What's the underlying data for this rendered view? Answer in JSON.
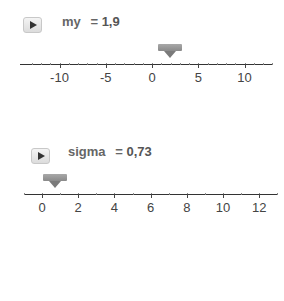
{
  "sliders": [
    {
      "name": "my",
      "equals": "=",
      "value_text": "1,9",
      "value": 1.9,
      "min": -13,
      "max": 13,
      "ticks": [
        {
          "label": "-10",
          "value": -10
        },
        {
          "label": "-5",
          "value": -5
        },
        {
          "label": "0",
          "value": 0
        },
        {
          "label": "5",
          "value": 5
        },
        {
          "label": "10",
          "value": 10
        }
      ],
      "play_icon": "play-icon"
    },
    {
      "name": "sigma",
      "equals": "=",
      "value_text": "0,73",
      "value": 0.73,
      "min": -1,
      "max": 13,
      "ticks": [
        {
          "label": "0",
          "value": 0
        },
        {
          "label": "2",
          "value": 2
        },
        {
          "label": "4",
          "value": 4
        },
        {
          "label": "6",
          "value": 6
        },
        {
          "label": "8",
          "value": 8
        },
        {
          "label": "10",
          "value": 10
        },
        {
          "label": "12",
          "value": 12
        }
      ],
      "play_icon": "play-icon"
    }
  ]
}
